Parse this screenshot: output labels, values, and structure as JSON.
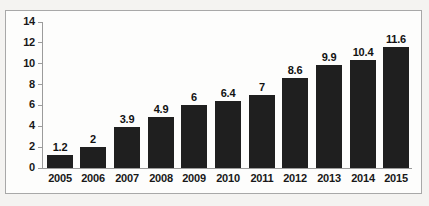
{
  "chart_data": {
    "type": "bar",
    "title": "",
    "subtitle": "",
    "xlabel": "",
    "ylabel": "",
    "categories": [
      "2005",
      "2006",
      "2007",
      "2008",
      "2009",
      "2010",
      "2011",
      "2012",
      "2013",
      "2014",
      "2015"
    ],
    "values": [
      1.2,
      2,
      3.9,
      4.9,
      6,
      6.4,
      7,
      8.6,
      9.9,
      10.4,
      11.6
    ],
    "value_labels": [
      "1.2",
      "2",
      "3.9",
      "4.9",
      "6",
      "6.4",
      "7",
      "8.6",
      "9.9",
      "10.4",
      "11.6"
    ],
    "ylim": [
      0,
      14
    ],
    "yticks": [
      0,
      2,
      4,
      6,
      8,
      10,
      12,
      14
    ],
    "ytick_labels": [
      "0",
      "2",
      "4",
      "6",
      "8",
      "10",
      "12",
      "14"
    ],
    "grid": false,
    "legend": null,
    "legend_position": "none",
    "bar_color": "#1f1f1f",
    "axis_color": "#9b9b9b",
    "plot_background": "#fdfdfc",
    "page_background": "#f4f3f1",
    "frame_border_color": "#a8a8a8",
    "label_color": "#181818"
  }
}
